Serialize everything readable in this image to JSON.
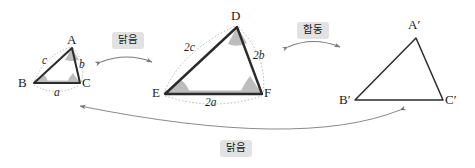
{
  "figure": {
    "colors": {
      "stroke": "#2b2b2b",
      "thin_stroke": "#555555",
      "dotted": "#9a9a9a",
      "angle_fill": "#b9b9b9",
      "base_fill": "#b0b0b0",
      "tag_bg": "#e2e2e2",
      "arrow": "#6f6f6f",
      "background": "#ffffff"
    }
  },
  "triangles": [
    {
      "id": "abc",
      "name": "small-triangle-abc",
      "vertices": [
        {
          "name": "vertex-a",
          "label": "A",
          "x": 72,
          "y": 48,
          "label_x": 67,
          "label_y": 33
        },
        {
          "name": "vertex-b",
          "label": "B",
          "x": 34,
          "y": 83,
          "label_x": 18,
          "label_y": 78
        },
        {
          "name": "vertex-c",
          "label": "C",
          "x": 80,
          "y": 83,
          "label_x": 82,
          "label_y": 78
        }
      ],
      "side_labels": [
        {
          "name": "side-label-c",
          "text": "c",
          "x": 42,
          "y": 58
        },
        {
          "name": "side-label-b",
          "text": "b",
          "x": 79,
          "y": 62
        },
        {
          "name": "side-label-a",
          "text": "a",
          "x": 54,
          "y": 90
        }
      ]
    },
    {
      "id": "def",
      "name": "large-triangle-def",
      "vertices": [
        {
          "name": "vertex-d",
          "label": "D",
          "x": 237,
          "y": 27,
          "label_x": 231,
          "label_y": 11
        },
        {
          "name": "vertex-e",
          "label": "E",
          "x": 165,
          "y": 94,
          "label_x": 152,
          "label_y": 88
        },
        {
          "name": "vertex-f",
          "label": "F",
          "x": 262,
          "y": 94,
          "label_x": 264,
          "label_y": 88
        }
      ],
      "side_labels": [
        {
          "name": "side-label-2c",
          "text": "2c",
          "x": 184,
          "y": 45
        },
        {
          "name": "side-label-2b",
          "text": "2b",
          "x": 254,
          "y": 52
        },
        {
          "name": "side-label-2a",
          "text": "2a",
          "x": 205,
          "y": 100
        }
      ]
    },
    {
      "id": "abc-prime",
      "name": "triangle-a-prime-b-prime-c-prime",
      "vertices": [
        {
          "name": "vertex-a-prime",
          "label": "A′",
          "x": 416,
          "y": 38,
          "label_x": 408,
          "label_y": 20
        },
        {
          "name": "vertex-b-prime",
          "label": "B′",
          "x": 355,
          "y": 100,
          "label_x": 339,
          "label_y": 95
        },
        {
          "name": "vertex-c-prime",
          "label": "C′",
          "x": 443,
          "y": 100,
          "label_x": 445,
          "label_y": 95
        }
      ],
      "side_labels": []
    }
  ],
  "relations": [
    {
      "name": "relation-tag-similar-top-left",
      "label": "닭음",
      "meaning": "similar",
      "tag_x": 112,
      "tag_y": 32
    },
    {
      "name": "relation-tag-congruent-top-right",
      "label": "합동",
      "meaning": "congruent",
      "tag_x": 297,
      "tag_y": 22
    },
    {
      "name": "relation-tag-similar-bottom",
      "label": "닭음",
      "meaning": "similar",
      "tag_x": 220,
      "tag_y": 140
    }
  ]
}
